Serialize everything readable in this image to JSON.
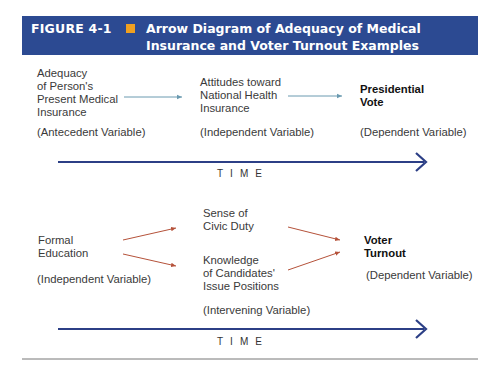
{
  "figure": {
    "label": "FIGURE 4-1",
    "title": "Arrow Diagram of Adequacy of Medical Insurance and Voter Turnout Examples",
    "header_bg": "#2c4a92",
    "accent_square": "#f0a020"
  },
  "diagram1": {
    "antecedent": {
      "lines": [
        "Adequacy",
        "of Person's",
        "Present Medical",
        "Insurance"
      ],
      "role": "(Antecedent Variable)"
    },
    "independent": {
      "lines": [
        "Attitudes toward",
        "National Health",
        "Insurance"
      ],
      "role": "(Independent Variable)"
    },
    "dependent": {
      "lines": [
        "Presidential",
        "Vote"
      ],
      "role": "(Dependent Variable)"
    },
    "arrow_color": "#6a9ab0",
    "time_label": "TIME"
  },
  "diagram2": {
    "independent": {
      "lines": [
        "Formal",
        "Education"
      ],
      "role": "(Independent Variable)"
    },
    "intervening": {
      "a_lines": [
        "Sense of",
        "Civic Duty"
      ],
      "b_lines": [
        "Knowledge",
        "of Candidates'",
        "Issue Positions"
      ],
      "role": "(Intervening Variable)"
    },
    "dependent": {
      "lines": [
        "Voter",
        "Turnout"
      ],
      "role": "(Dependent Variable)"
    },
    "arrow_color": "#b5523a",
    "time_label": "TIME"
  },
  "time_arrow_color": "#2c3f86"
}
